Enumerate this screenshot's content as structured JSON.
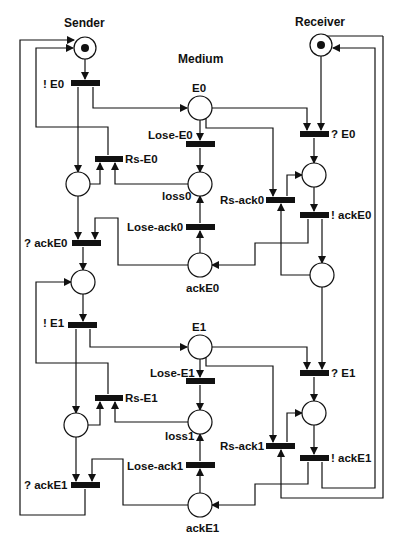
{
  "headers": {
    "sender": "Sender",
    "medium": "Medium",
    "receiver": "Receiver"
  },
  "places": {
    "sender_init": {
      "label": "",
      "tokens": 1
    },
    "sender_wait0": {
      "label": "",
      "tokens": 0
    },
    "sender_ready1": {
      "label": "",
      "tokens": 0
    },
    "sender_wait1": {
      "label": "",
      "tokens": 0
    },
    "E0": {
      "label": "E0",
      "tokens": 0
    },
    "loss0": {
      "label": "loss0",
      "tokens": 0
    },
    "ackE0": {
      "label": "ackE0",
      "tokens": 0
    },
    "E1": {
      "label": "E1",
      "tokens": 0
    },
    "loss1": {
      "label": "loss1",
      "tokens": 0
    },
    "ackE1": {
      "label": "ackE1",
      "tokens": 0
    },
    "receiver_init": {
      "label": "",
      "tokens": 1
    },
    "receiver_got0": {
      "label": "",
      "tokens": 0
    },
    "receiver_ready1": {
      "label": "",
      "tokens": 0
    },
    "receiver_got1": {
      "label": "",
      "tokens": 0
    }
  },
  "transitions": {
    "send_E0": "! E0",
    "rs_E0": "Rs-E0",
    "recv_ackE0": "? ackE0",
    "send_E1": "! E1",
    "rs_E1": "Rs-E1",
    "recv_ackE1": "? ackE1",
    "lose_E0": "Lose-E0",
    "lose_ack0": "Lose-ack0",
    "lose_E1": "Lose-E1",
    "lose_ack1": "Lose-ack1",
    "recv_E0": "? E0",
    "send_ackE0": "! ackE0",
    "rs_ack0": "Rs-ack0",
    "recv_E1": "? E1",
    "send_ackE1": "! ackE1",
    "rs_ack1": "Rs-ack1"
  },
  "colors": {
    "stroke": "#111111",
    "background": "#ffffff"
  }
}
